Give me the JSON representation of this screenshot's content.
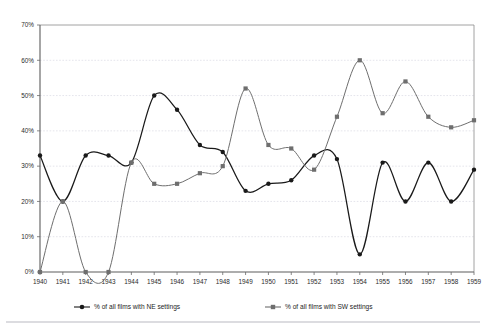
{
  "chart_data": {
    "type": "line",
    "title": "",
    "xlabel": "",
    "ylabel": "",
    "x": [
      1940,
      1941,
      1942,
      1943,
      1944,
      1945,
      1946,
      1947,
      1948,
      1949,
      1950,
      1951,
      1952,
      1953,
      1954,
      1955,
      1956,
      1957,
      1958,
      1959
    ],
    "categories": [
      "1940",
      "1941",
      "1942",
      "1943",
      "1944",
      "1945",
      "1946",
      "1947",
      "1948",
      "1949",
      "1950",
      "1951",
      "1952",
      "1953",
      "1954",
      "1955",
      "1956",
      "1957",
      "1958",
      "1959"
    ],
    "xlim": [
      1940,
      1959
    ],
    "ylim": [
      0,
      70
    ],
    "ytick_values": [
      0,
      10,
      20,
      30,
      40,
      50,
      60,
      70
    ],
    "ytick_labels": [
      "0%",
      "10%",
      "20%",
      "30%",
      "40%",
      "50%",
      "60%",
      "70%"
    ],
    "grid": true,
    "legend_position": "bottom",
    "series": [
      {
        "name": "% of all films with NE settings",
        "color": "#1a1a1a",
        "marker": "circle",
        "values": [
          33,
          20,
          33,
          33,
          31,
          50,
          46,
          36,
          34,
          23,
          25,
          26,
          33,
          32,
          5,
          31,
          20,
          31,
          20,
          29
        ]
      },
      {
        "name": "% of all films with SW settings",
        "color": "#6e6e6e",
        "marker": "square",
        "values": [
          0,
          20,
          0,
          0,
          31,
          25,
          25,
          28,
          30,
          52,
          36,
          35,
          29,
          44,
          60,
          45,
          54,
          44,
          41,
          43
        ]
      }
    ]
  },
  "legend": {
    "items": [
      {
        "label": "% of all films with NE settings",
        "color": "#1a1a1a",
        "marker": "circle"
      },
      {
        "label": "% of all films with SW settings",
        "color": "#6e6e6e",
        "marker": "square"
      }
    ]
  }
}
